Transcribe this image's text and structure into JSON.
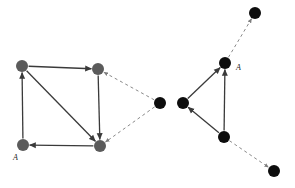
{
  "figure": {
    "background_color": "#ffffff",
    "width": 295,
    "height": 188
  },
  "style": {
    "gray_node_color": "#5b5b5b",
    "black_node_color": "#0d0d0d",
    "solid_edge_color": "#3a3a3a",
    "dashed_edge_color": "#8a8a8a",
    "label_color": "#1a1a1a",
    "node_radius": 6.0,
    "solid_edge_width": 1.3,
    "dashed_edge_width": 1.0,
    "dash_pattern": "3,3"
  },
  "left_graph": {
    "name": "left-square-graph",
    "nodes": [
      {
        "id": "L-TL",
        "name": "left-node-top-left",
        "x": 22,
        "y": 66,
        "color": "#5b5b5b",
        "label": ""
      },
      {
        "id": "L-TR",
        "name": "left-node-top-right",
        "x": 98,
        "y": 69,
        "color": "#5b5b5b",
        "label": ""
      },
      {
        "id": "L-BL",
        "name": "left-node-bottom-left",
        "x": 23,
        "y": 145,
        "color": "#5b5b5b",
        "label": "A"
      },
      {
        "id": "L-BR",
        "name": "left-node-bottom-right",
        "x": 100,
        "y": 146,
        "color": "#5b5b5b",
        "label": ""
      }
    ],
    "edges": [
      {
        "name": "edge-bl-to-tl",
        "from": "L-BL",
        "to": "L-TL",
        "style": "solid",
        "arrow": true
      },
      {
        "name": "edge-tl-to-tr",
        "from": "L-TL",
        "to": "L-TR",
        "style": "solid",
        "arrow": true
      },
      {
        "name": "edge-tl-to-br",
        "from": "L-TL",
        "to": "L-BR",
        "style": "solid",
        "arrow": true
      },
      {
        "name": "edge-tr-to-br",
        "from": "L-TR",
        "to": "L-BR",
        "style": "solid",
        "arrow": true
      },
      {
        "name": "edge-br-to-bl",
        "from": "L-BR",
        "to": "L-BL",
        "style": "solid",
        "arrow": true
      }
    ],
    "label": {
      "name": "left-graph-label-A",
      "text": "A",
      "x": 13,
      "y": 160
    }
  },
  "center": {
    "node": {
      "id": "C-1",
      "name": "center-black-node",
      "x": 160,
      "y": 103,
      "color": "#0d0d0d"
    },
    "dashed_edges": [
      {
        "name": "dashed-edge-center-to-left-tr",
        "from": "C-1",
        "to": "L-TR",
        "style": "dashed",
        "arrow": true
      },
      {
        "name": "dashed-edge-center-to-left-br",
        "from": "C-1",
        "to": "L-BR",
        "style": "dashed",
        "arrow": true
      }
    ]
  },
  "right_graph": {
    "name": "right-triangle-graph",
    "nodes": [
      {
        "id": "R-L",
        "name": "right-node-left",
        "x": 183,
        "y": 103,
        "color": "#0d0d0d",
        "label": ""
      },
      {
        "id": "R-T",
        "name": "right-node-top",
        "x": 225,
        "y": 63,
        "color": "#0d0d0d",
        "label": "A"
      },
      {
        "id": "R-B",
        "name": "right-node-bottom",
        "x": 224,
        "y": 137,
        "color": "#0d0d0d",
        "label": ""
      }
    ],
    "edges": [
      {
        "name": "edge-rleft-to-rtop",
        "from": "R-L",
        "to": "R-T",
        "style": "solid",
        "arrow": true
      },
      {
        "name": "edge-rbottom-to-rtop",
        "from": "R-B",
        "to": "R-T",
        "style": "solid",
        "arrow": true
      },
      {
        "name": "edge-rbottom-to-rleft",
        "from": "R-B",
        "to": "R-L",
        "style": "solid",
        "arrow": true
      }
    ],
    "label": {
      "name": "right-graph-label-A",
      "text": "A",
      "x": 236,
      "y": 70
    },
    "outer_nodes": [
      {
        "id": "O-TR",
        "name": "outer-node-top-right",
        "x": 255,
        "y": 13,
        "color": "#0d0d0d"
      },
      {
        "id": "O-BR",
        "name": "outer-node-bottom-right",
        "x": 274,
        "y": 171,
        "color": "#0d0d0d"
      }
    ],
    "dashed_edges": [
      {
        "name": "dashed-edge-rtop-to-outer-tr",
        "from": "R-T",
        "to": "O-TR",
        "style": "dashed",
        "arrow": true
      },
      {
        "name": "dashed-edge-rbottom-to-outer-br",
        "from": "R-B",
        "to": "O-BR",
        "style": "dashed",
        "arrow": true
      }
    ]
  }
}
